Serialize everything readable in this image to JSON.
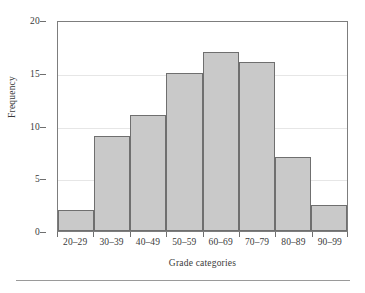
{
  "chart_data": {
    "type": "bar",
    "title": "",
    "xlabel": "Grade categories",
    "ylabel": "Frequency",
    "categories": [
      "20–29",
      "30–39",
      "40–49",
      "50–59",
      "60–69",
      "70–79",
      "80–89",
      "90–99"
    ],
    "values": [
      2,
      9,
      11,
      15,
      17,
      16,
      7,
      2.5
    ],
    "ylim": [
      0,
      20
    ],
    "yticks": [
      0,
      5,
      10,
      15,
      20
    ],
    "ytick_labels": [
      "0",
      "5",
      "10",
      "15",
      "20"
    ],
    "grid": true,
    "legend": null,
    "bar_color": "#c9c9c9",
    "bar_edge_color": "#6f6f6f",
    "axis_color": "#7d7d7d",
    "grid_color": "#e6e6e6",
    "background": "#ffffff"
  }
}
